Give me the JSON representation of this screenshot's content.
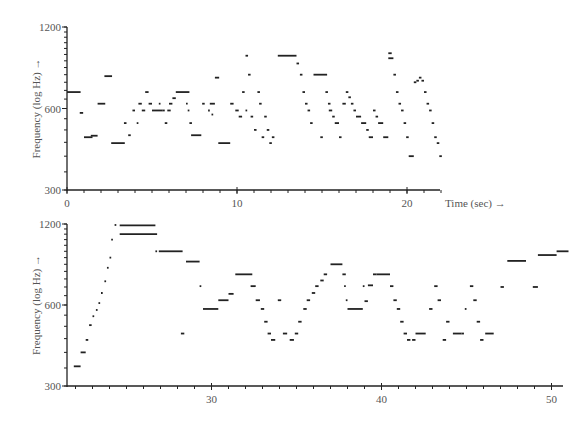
{
  "chart_data": [
    {
      "type": "scatter",
      "title": "",
      "xlabel": "Time (sec) →",
      "ylabel": "Frequency (log Hz) →",
      "yscale": "log",
      "xlim": [
        0,
        22.4
      ],
      "ylim": [
        300,
        1200
      ],
      "grid": false,
      "x_ticks": [
        0,
        10,
        20
      ],
      "x_minor_step": 1,
      "y_ticks": [
        300,
        600,
        1200
      ],
      "y_tick_labels": [
        "300",
        "600",
        "1200"
      ],
      "segments": [
        [
          0.0,
          0.8,
          690
        ],
        [
          0.75,
          0.95,
          578
        ],
        [
          1.0,
          1.5,
          470
        ],
        [
          1.4,
          1.8,
          476
        ],
        [
          1.8,
          2.25,
          625
        ],
        [
          2.2,
          2.65,
          790
        ],
        [
          2.6,
          3.4,
          447
        ],
        [
          3.35,
          3.5,
          530
        ],
        [
          3.6,
          3.75,
          478
        ],
        [
          3.85,
          4.0,
          590
        ],
        [
          4.1,
          4.2,
          530
        ],
        [
          4.2,
          4.4,
          625
        ],
        [
          4.4,
          4.6,
          590
        ],
        [
          4.6,
          4.8,
          690
        ],
        [
          4.8,
          5.0,
          625
        ],
        [
          5.0,
          5.6,
          590
        ],
        [
          5.4,
          5.5,
          625
        ],
        [
          5.6,
          5.75,
          590
        ],
        [
          5.75,
          5.9,
          530
        ],
        [
          5.9,
          6.1,
          590
        ],
        [
          6.0,
          6.2,
          625
        ],
        [
          6.2,
          6.4,
          655
        ],
        [
          6.4,
          7.2,
          690
        ],
        [
          7.0,
          7.1,
          625
        ],
        [
          7.1,
          7.2,
          590
        ],
        [
          7.2,
          7.35,
          530
        ],
        [
          7.3,
          7.9,
          478
        ],
        [
          7.95,
          8.1,
          625
        ],
        [
          8.3,
          8.4,
          590
        ],
        [
          8.4,
          8.7,
          625
        ],
        [
          8.5,
          8.6,
          570
        ],
        [
          8.7,
          8.95,
          780
        ],
        [
          8.9,
          9.6,
          447
        ],
        [
          9.6,
          9.8,
          625
        ],
        [
          9.9,
          10.1,
          590
        ],
        [
          10.1,
          10.3,
          560
        ],
        [
          10.3,
          10.45,
          690
        ],
        [
          10.5,
          10.65,
          940
        ],
        [
          10.5,
          10.6,
          590
        ],
        [
          10.65,
          10.8,
          800
        ],
        [
          10.8,
          10.95,
          560
        ],
        [
          11.0,
          11.15,
          500
        ],
        [
          11.2,
          11.35,
          690
        ],
        [
          11.3,
          11.45,
          625
        ],
        [
          11.45,
          11.6,
          470
        ],
        [
          11.6,
          11.75,
          560
        ],
        [
          11.75,
          11.9,
          500
        ],
        [
          11.9,
          12.05,
          447
        ],
        [
          12.05,
          12.2,
          470
        ],
        [
          12.4,
          13.5,
          940
        ],
        [
          13.5,
          13.65,
          880
        ],
        [
          13.7,
          13.85,
          800
        ],
        [
          13.85,
          14.0,
          690
        ],
        [
          14.0,
          14.15,
          625
        ],
        [
          14.15,
          14.3,
          590
        ],
        [
          14.3,
          14.45,
          530
        ],
        [
          14.5,
          15.3,
          800
        ],
        [
          14.9,
          15.05,
          470
        ],
        [
          15.2,
          15.35,
          690
        ],
        [
          15.35,
          15.5,
          625
        ],
        [
          15.4,
          15.6,
          590
        ],
        [
          15.6,
          15.75,
          560
        ],
        [
          15.75,
          16.0,
          530
        ],
        [
          16.0,
          16.15,
          470
        ],
        [
          16.2,
          16.4,
          625
        ],
        [
          16.4,
          16.55,
          690
        ],
        [
          16.55,
          16.7,
          660
        ],
        [
          16.7,
          16.85,
          625
        ],
        [
          16.85,
          17.0,
          590
        ],
        [
          17.0,
          17.3,
          560
        ],
        [
          17.3,
          17.6,
          530
        ],
        [
          17.6,
          17.75,
          500
        ],
        [
          17.75,
          18.0,
          470
        ],
        [
          18.0,
          18.15,
          590
        ],
        [
          18.15,
          18.3,
          560
        ],
        [
          18.3,
          18.6,
          530
        ],
        [
          18.6,
          18.9,
          470
        ],
        [
          18.9,
          19.1,
          960
        ],
        [
          18.9,
          19.2,
          920
        ],
        [
          19.2,
          19.35,
          800
        ],
        [
          19.35,
          19.5,
          690
        ],
        [
          19.5,
          19.65,
          625
        ],
        [
          19.65,
          19.8,
          590
        ],
        [
          19.8,
          19.95,
          530
        ],
        [
          19.95,
          20.1,
          470
        ],
        [
          20.1,
          20.4,
          400
        ],
        [
          20.4,
          20.55,
          750
        ],
        [
          20.55,
          20.7,
          760
        ],
        [
          20.7,
          20.85,
          780
        ],
        [
          20.85,
          21.0,
          760
        ],
        [
          21.0,
          21.15,
          690
        ],
        [
          21.15,
          21.3,
          625
        ],
        [
          21.3,
          21.45,
          590
        ],
        [
          21.45,
          21.6,
          530
        ],
        [
          21.6,
          21.75,
          470
        ],
        [
          21.75,
          21.9,
          447
        ],
        [
          21.9,
          22.05,
          400
        ]
      ]
    },
    {
      "type": "scatter",
      "title": "",
      "xlabel": "",
      "ylabel": "Frequency (log Hz) →",
      "yscale": "log",
      "xlim": [
        21.5,
        50.5
      ],
      "ylim": [
        300,
        1200
      ],
      "grid": false,
      "x_ticks": [
        30,
        40,
        50
      ],
      "x_minor_step": 1,
      "y_ticks": [
        300,
        600,
        1200
      ],
      "y_tick_labels": [
        "300",
        "600",
        "1200"
      ],
      "segments": [
        [
          21.9,
          22.3,
          355
        ],
        [
          22.3,
          22.6,
          400
        ],
        [
          22.6,
          22.75,
          445
        ],
        [
          22.8,
          22.95,
          505
        ],
        [
          23.0,
          23.1,
          545
        ],
        [
          23.2,
          23.3,
          575
        ],
        [
          23.35,
          23.45,
          610
        ],
        [
          23.5,
          23.6,
          665
        ],
        [
          23.7,
          23.8,
          735
        ],
        [
          23.85,
          23.95,
          825
        ],
        [
          24.0,
          24.1,
          900
        ],
        [
          24.1,
          24.2,
          1050
        ],
        [
          24.3,
          24.4,
          1190
        ],
        [
          24.6,
          26.7,
          1185
        ],
        [
          24.6,
          26.8,
          1100
        ],
        [
          26.7,
          26.8,
          950
        ],
        [
          26.9,
          28.3,
          950
        ],
        [
          28.2,
          28.4,
          470
        ],
        [
          28.5,
          29.3,
          870
        ],
        [
          29.3,
          29.4,
          705
        ],
        [
          29.5,
          30.4,
          580
        ],
        [
          30.4,
          31.0,
          625
        ],
        [
          31.0,
          31.3,
          660
        ],
        [
          31.4,
          32.4,
          780
        ],
        [
          32.3,
          32.6,
          705
        ],
        [
          32.6,
          32.85,
          625
        ],
        [
          32.9,
          33.1,
          580
        ],
        [
          33.1,
          33.3,
          520
        ],
        [
          33.3,
          33.5,
          470
        ],
        [
          33.5,
          33.75,
          445
        ],
        [
          33.9,
          34.1,
          625
        ],
        [
          34.2,
          34.45,
          470
        ],
        [
          34.6,
          34.85,
          445
        ],
        [
          34.9,
          35.1,
          470
        ],
        [
          35.1,
          35.3,
          520
        ],
        [
          35.4,
          35.6,
          580
        ],
        [
          35.6,
          35.8,
          625
        ],
        [
          35.9,
          36.1,
          665
        ],
        [
          36.1,
          36.3,
          705
        ],
        [
          36.4,
          36.6,
          740
        ],
        [
          36.6,
          36.8,
          780
        ],
        [
          37.0,
          37.7,
          850
        ],
        [
          37.7,
          37.9,
          780
        ],
        [
          37.8,
          37.9,
          705
        ],
        [
          37.9,
          38.0,
          625
        ],
        [
          38.0,
          38.9,
          580
        ],
        [
          38.9,
          39.0,
          705
        ],
        [
          39.0,
          39.2,
          620
        ],
        [
          39.2,
          39.5,
          710
        ],
        [
          39.5,
          39.7,
          780
        ],
        [
          39.7,
          40.5,
          780
        ],
        [
          40.5,
          40.7,
          705
        ],
        [
          40.7,
          40.9,
          625
        ],
        [
          40.9,
          41.1,
          580
        ],
        [
          41.1,
          41.3,
          520
        ],
        [
          41.3,
          41.5,
          470
        ],
        [
          41.5,
          41.7,
          445
        ],
        [
          41.8,
          42.0,
          445
        ],
        [
          42.0,
          42.6,
          470
        ],
        [
          42.8,
          43.0,
          580
        ],
        [
          43.1,
          43.3,
          705
        ],
        [
          43.3,
          43.5,
          625
        ],
        [
          43.6,
          43.8,
          445
        ],
        [
          43.8,
          44.0,
          520
        ],
        [
          44.2,
          44.7,
          470
        ],
        [
          44.7,
          44.85,
          470
        ],
        [
          44.9,
          45.0,
          580
        ],
        [
          45.2,
          45.4,
          705
        ],
        [
          45.4,
          45.6,
          625
        ],
        [
          45.6,
          45.8,
          520
        ],
        [
          45.8,
          46.0,
          445
        ],
        [
          46.1,
          46.6,
          470
        ],
        [
          47.0,
          47.2,
          700
        ],
        [
          47.4,
          48.5,
          875
        ],
        [
          48.9,
          49.2,
          700
        ],
        [
          49.2,
          50.3,
          920
        ],
        [
          50.3,
          51.0,
          950
        ]
      ]
    }
  ]
}
